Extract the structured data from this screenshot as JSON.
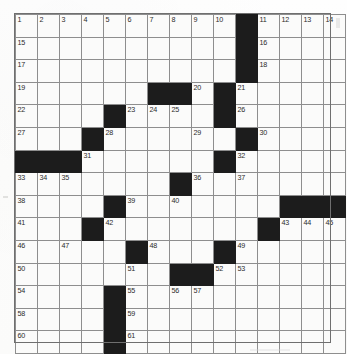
{
  "puzzle": {
    "kind": "crossword-grid",
    "rows": 15,
    "columns": 15,
    "colors": {
      "blocked": "#1c1c1c",
      "open": "#fbfbfa",
      "gridline": "#8e8e8e",
      "number": "#2b2b2b",
      "page": "#fdfdfd"
    },
    "blocked_cells": [
      [
        1,
        11
      ],
      [
        2,
        11
      ],
      [
        3,
        11
      ],
      [
        4,
        7
      ],
      [
        4,
        8
      ],
      [
        4,
        10
      ],
      [
        5,
        5
      ],
      [
        5,
        10
      ],
      [
        6,
        4
      ],
      [
        6,
        11
      ],
      [
        7,
        1
      ],
      [
        7,
        2
      ],
      [
        7,
        3
      ],
      [
        7,
        10
      ],
      [
        8,
        8
      ],
      [
        9,
        5
      ],
      [
        9,
        13
      ],
      [
        9,
        14
      ],
      [
        9,
        15
      ],
      [
        10,
        4
      ],
      [
        10,
        12
      ],
      [
        11,
        6
      ],
      [
        11,
        10
      ],
      [
        12,
        8
      ],
      [
        12,
        9
      ],
      [
        13,
        5
      ],
      [
        14,
        5
      ],
      [
        15,
        5
      ]
    ],
    "numbered_cells": [
      {
        "number": "1",
        "row": 1,
        "col": 1
      },
      {
        "number": "2",
        "row": 1,
        "col": 2
      },
      {
        "number": "3",
        "row": 1,
        "col": 3
      },
      {
        "number": "4",
        "row": 1,
        "col": 4
      },
      {
        "number": "5",
        "row": 1,
        "col": 5
      },
      {
        "number": "6",
        "row": 1,
        "col": 6
      },
      {
        "number": "7",
        "row": 1,
        "col": 7
      },
      {
        "number": "8",
        "row": 1,
        "col": 8
      },
      {
        "number": "9",
        "row": 1,
        "col": 9
      },
      {
        "number": "10",
        "row": 1,
        "col": 10
      },
      {
        "number": "11",
        "row": 1,
        "col": 12
      },
      {
        "number": "12",
        "row": 1,
        "col": 13
      },
      {
        "number": "13",
        "row": 1,
        "col": 14
      },
      {
        "number": "14",
        "row": 1,
        "col": 15
      },
      {
        "number": "15",
        "row": 2,
        "col": 1
      },
      {
        "number": "16",
        "row": 2,
        "col": 12
      },
      {
        "number": "17",
        "row": 3,
        "col": 1
      },
      {
        "number": "18",
        "row": 3,
        "col": 12
      },
      {
        "number": "19",
        "row": 4,
        "col": 1
      },
      {
        "number": "20",
        "row": 4,
        "col": 9
      },
      {
        "number": "21",
        "row": 4,
        "col": 11
      },
      {
        "number": "22",
        "row": 5,
        "col": 1
      },
      {
        "number": "23",
        "row": 5,
        "col": 6
      },
      {
        "number": "24",
        "row": 5,
        "col": 7
      },
      {
        "number": "25",
        "row": 5,
        "col": 8
      },
      {
        "number": "26",
        "row": 5,
        "col": 11
      },
      {
        "number": "27",
        "row": 6,
        "col": 1
      },
      {
        "number": "28",
        "row": 6,
        "col": 5
      },
      {
        "number": "29",
        "row": 6,
        "col": 9
      },
      {
        "number": "30",
        "row": 6,
        "col": 12
      },
      {
        "number": "31",
        "row": 7,
        "col": 4
      },
      {
        "number": "32",
        "row": 7,
        "col": 11
      },
      {
        "number": "33",
        "row": 8,
        "col": 1
      },
      {
        "number": "34",
        "row": 8,
        "col": 2
      },
      {
        "number": "35",
        "row": 8,
        "col": 3
      },
      {
        "number": "36",
        "row": 8,
        "col": 9
      },
      {
        "number": "37",
        "row": 8,
        "col": 11
      },
      {
        "number": "38",
        "row": 9,
        "col": 1
      },
      {
        "number": "39",
        "row": 9,
        "col": 6
      },
      {
        "number": "40",
        "row": 9,
        "col": 8
      },
      {
        "number": "41",
        "row": 10,
        "col": 1
      },
      {
        "number": "42",
        "row": 10,
        "col": 5
      },
      {
        "number": "43",
        "row": 10,
        "col": 13
      },
      {
        "number": "44",
        "row": 10,
        "col": 14
      },
      {
        "number": "45",
        "row": 10,
        "col": 15
      },
      {
        "number": "46",
        "row": 11,
        "col": 1
      },
      {
        "number": "47",
        "row": 11,
        "col": 3
      },
      {
        "number": "48",
        "row": 11,
        "col": 7
      },
      {
        "number": "49",
        "row": 11,
        "col": 11
      },
      {
        "number": "50",
        "row": 12,
        "col": 1
      },
      {
        "number": "51",
        "row": 12,
        "col": 6
      },
      {
        "number": "52",
        "row": 12,
        "col": 10
      },
      {
        "number": "53",
        "row": 12,
        "col": 11
      },
      {
        "number": "54",
        "row": 13,
        "col": 1
      },
      {
        "number": "55",
        "row": 13,
        "col": 6
      },
      {
        "number": "56",
        "row": 13,
        "col": 8
      },
      {
        "number": "57",
        "row": 13,
        "col": 9
      },
      {
        "number": "58",
        "row": 14,
        "col": 1
      },
      {
        "number": "59",
        "row": 14,
        "col": 6
      },
      {
        "number": "60",
        "row": 15,
        "col": 1
      },
      {
        "number": "61",
        "row": 15,
        "col": 6
      }
    ]
  }
}
